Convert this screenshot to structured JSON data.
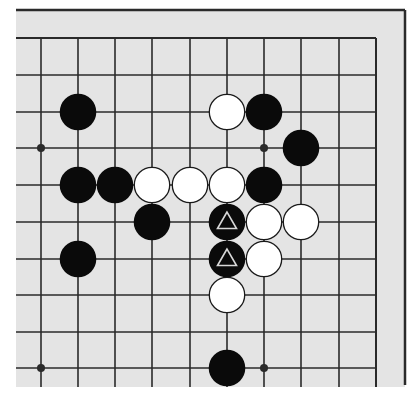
{
  "diagram": {
    "type": "go-board-fragment",
    "board_color": "#e4e4e4",
    "line_color": "#2a2a2a",
    "black_color": "#0a0a0a",
    "white_color": "#ffffff",
    "marker_color": "#d8d8d8",
    "columns_visible": 10,
    "rows_visible": 10,
    "grid": {
      "x": [
        41,
        78,
        115,
        152,
        190,
        227,
        264,
        301,
        339,
        376
      ],
      "y": [
        38,
        75,
        112,
        148,
        185,
        222,
        259,
        295,
        332,
        368
      ]
    },
    "edges": {
      "top": true,
      "right": true,
      "left": false,
      "bottom": false
    },
    "hoshi": [
      {
        "col": 0,
        "row": 3
      },
      {
        "col": 6,
        "row": 3
      },
      {
        "col": 0,
        "row": 9
      },
      {
        "col": 6,
        "row": 9
      }
    ],
    "stones": [
      {
        "color": "black",
        "col": 1,
        "row": 2
      },
      {
        "color": "white",
        "col": 5,
        "row": 2
      },
      {
        "color": "black",
        "col": 6,
        "row": 2
      },
      {
        "color": "black",
        "col": 7,
        "row": 3
      },
      {
        "color": "black",
        "col": 1,
        "row": 4
      },
      {
        "color": "black",
        "col": 2,
        "row": 4
      },
      {
        "color": "white",
        "col": 3,
        "row": 4
      },
      {
        "color": "white",
        "col": 4,
        "row": 4
      },
      {
        "color": "white",
        "col": 5,
        "row": 4
      },
      {
        "color": "black",
        "col": 6,
        "row": 4
      },
      {
        "color": "black",
        "col": 3,
        "row": 5
      },
      {
        "color": "black",
        "col": 5,
        "row": 5,
        "marker": "triangle"
      },
      {
        "color": "white",
        "col": 6,
        "row": 5
      },
      {
        "color": "white",
        "col": 7,
        "row": 5
      },
      {
        "color": "black",
        "col": 1,
        "row": 6
      },
      {
        "color": "black",
        "col": 5,
        "row": 6,
        "marker": "triangle"
      },
      {
        "color": "white",
        "col": 6,
        "row": 6
      },
      {
        "color": "white",
        "col": 5,
        "row": 7
      },
      {
        "color": "black",
        "col": 5,
        "row": 9
      }
    ]
  }
}
